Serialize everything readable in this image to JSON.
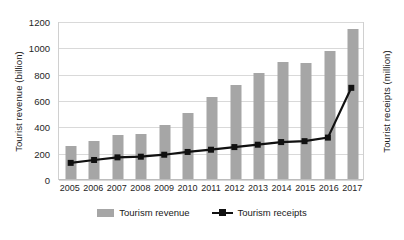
{
  "chart_data": {
    "type": "bar",
    "title": "",
    "xlabel": "",
    "ylabel": "Tourist revenue (billion)",
    "y2label": "Tourist receipts (million)",
    "categories": [
      "2005",
      "2006",
      "2007",
      "2008",
      "2009",
      "2010",
      "2011",
      "2012",
      "2013",
      "2014",
      "2015",
      "2016",
      "2017"
    ],
    "ylim": [
      0,
      1200
    ],
    "yticks": [
      0,
      200,
      400,
      600,
      800,
      1000,
      1200
    ],
    "y2lim": [
      0,
      1200
    ],
    "grid": true,
    "legend_position": "bottom",
    "series": [
      {
        "name": "Tourism revenue",
        "type": "bar",
        "axis": "left",
        "color": "#a6a6a6",
        "values": [
          258,
          295,
          340,
          352,
          420,
          512,
          630,
          725,
          815,
          895,
          890,
          980,
          1145
        ]
      },
      {
        "name": "Tourism receipts",
        "type": "line",
        "axis": "right",
        "color": "#111111",
        "values": [
          130,
          152,
          172,
          177,
          192,
          213,
          230,
          250,
          268,
          288,
          295,
          322,
          700
        ]
      }
    ]
  },
  "legend": {
    "items": [
      {
        "label": "Tourism revenue",
        "marker": "bar-swatch"
      },
      {
        "label": "Tourism receipts",
        "marker": "line-marker-swatch"
      }
    ]
  }
}
